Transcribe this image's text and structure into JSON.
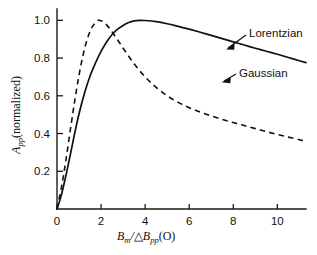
{
  "figure": {
    "background": "#ffffff",
    "ink": "#111111"
  },
  "axes": {
    "x_ticklabels": [
      "0",
      "2",
      "4",
      "6",
      "8",
      "10"
    ],
    "y_ticklabels": [
      "0.2",
      "0.4",
      "0.6",
      "0.8",
      "1.0"
    ],
    "x_title_parts": {
      "b1": "B",
      "sub1": "m",
      "slash": "/",
      "delta": "△",
      "b2": "B",
      "sub2": "pp",
      "unit": "(O)"
    },
    "y_title_parts": {
      "a": "A",
      "sub": "pp",
      "rest": "(normalized)"
    }
  },
  "annotations": {
    "lorentzian": "Lorentzian",
    "gaussian": "Gaussian"
  },
  "chart_data": {
    "type": "line",
    "title": "",
    "xlabel": "B_m / ΔB_pp (O)",
    "ylabel": "A_pp (normalized)",
    "xlim": [
      0,
      11.3
    ],
    "ylim": [
      0,
      1.06
    ],
    "xticks": [
      0,
      2,
      4,
      6,
      8,
      10
    ],
    "yticks": [
      0.2,
      0.4,
      0.6,
      0.8,
      1.0
    ],
    "grid": false,
    "legend": "inline annotations with leader arrows",
    "series": [
      {
        "name": "Lorentzian",
        "style": "solid",
        "x": [
          0,
          0.2,
          0.4,
          0.6,
          0.8,
          1.0,
          1.25,
          1.5,
          1.75,
          2.0,
          2.25,
          2.5,
          2.75,
          3.0,
          3.25,
          3.5,
          3.75,
          4.0,
          4.5,
          5.0,
          5.5,
          6.0,
          6.5,
          7.0,
          7.5,
          8.0,
          8.5,
          9.0,
          9.5,
          10.0,
          10.5,
          11.0,
          11.3
        ],
        "y": [
          0.0,
          0.075,
          0.175,
          0.285,
          0.4,
          0.505,
          0.615,
          0.705,
          0.775,
          0.835,
          0.885,
          0.925,
          0.953,
          0.973,
          0.988,
          0.997,
          1.0,
          0.999,
          0.993,
          0.982,
          0.968,
          0.953,
          0.937,
          0.92,
          0.903,
          0.886,
          0.869,
          0.852,
          0.836,
          0.82,
          0.803,
          0.786,
          0.776
        ]
      },
      {
        "name": "Gaussian",
        "style": "dashed",
        "x": [
          0,
          0.2,
          0.4,
          0.6,
          0.8,
          1.0,
          1.2,
          1.4,
          1.6,
          1.8,
          1.9,
          2.0,
          2.2,
          2.4,
          2.6,
          2.8,
          3.0,
          3.5,
          4.0,
          4.5,
          5.0,
          5.5,
          6.0,
          6.5,
          7.0,
          7.5,
          8.0,
          8.5,
          9.0,
          9.5,
          10.0,
          10.5,
          11.0,
          11.3
        ],
        "y": [
          0.0,
          0.115,
          0.255,
          0.415,
          0.57,
          0.71,
          0.825,
          0.91,
          0.965,
          0.995,
          1.0,
          0.998,
          0.982,
          0.955,
          0.922,
          0.888,
          0.852,
          0.77,
          0.7,
          0.645,
          0.6,
          0.565,
          0.537,
          0.513,
          0.493,
          0.475,
          0.458,
          0.442,
          0.426,
          0.41,
          0.395,
          0.381,
          0.367,
          0.358
        ]
      }
    ],
    "annotations": [
      {
        "text": "Lorentzian",
        "points_to_series": "Lorentzian",
        "x": 7.7,
        "y": 0.89
      },
      {
        "text": "Gaussian",
        "points_to_series": "Gaussian",
        "x": 7.0,
        "y": 0.665
      }
    ]
  }
}
